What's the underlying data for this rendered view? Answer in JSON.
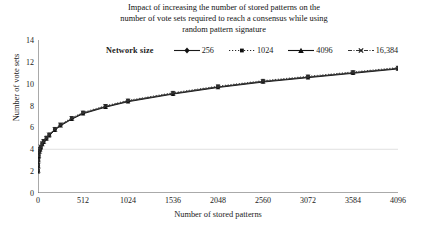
{
  "chart_data": {
    "type": "line",
    "title": "Impact of increasing the number of stored patterns on the number of vote sets required to reach a consensus while using random pattern signature",
    "title_lines": [
      "Impact of increasing the number of stored patterns on the",
      "number of vote sets required to reach a consensus while using",
      "random pattern signature"
    ],
    "xlabel": "Number of stored patterns",
    "ylabel": "Number of vote sets",
    "xlim": [
      0,
      4096
    ],
    "ylim": [
      0,
      14
    ],
    "xticks": [
      0,
      512,
      1024,
      1536,
      2048,
      2560,
      3072,
      3584,
      4096
    ],
    "xtick_labels": [
      "0",
      "512",
      "1024",
      "1536",
      "2048",
      "2560",
      "3072",
      "3584",
      "4096"
    ],
    "yticks": [
      0,
      2,
      4,
      6,
      8,
      10,
      12,
      14
    ],
    "ytick_labels": [
      "0",
      "2",
      "4",
      "6",
      "8",
      "10",
      "12",
      "14"
    ],
    "grid": "horizontal-faint",
    "gridlines_y": [
      4
    ],
    "legend_position": "top-center",
    "legend_title": "Network size",
    "x": [
      1,
      2,
      4,
      8,
      16,
      24,
      32,
      48,
      64,
      96,
      128,
      192,
      256,
      384,
      512,
      768,
      1024,
      1536,
      2048,
      2560,
      3072,
      3584,
      4096
    ],
    "series": [
      {
        "name": "256",
        "line_style": "solid",
        "marker": "diamond",
        "color": "#1a1a1a",
        "values": [
          2.0,
          2.5,
          3.0,
          3.4,
          3.8,
          4.0,
          4.2,
          4.5,
          4.7,
          5.0,
          5.3,
          5.8,
          6.2,
          6.8,
          7.3,
          7.9,
          8.4,
          9.1,
          9.7,
          10.2,
          10.6,
          11.0,
          11.4
        ]
      },
      {
        "name": "1024",
        "line_style": "dotted",
        "marker": "square",
        "color": "#2a2a2a",
        "values": [
          2.1,
          2.6,
          3.05,
          3.45,
          3.85,
          4.05,
          4.25,
          4.55,
          4.78,
          5.08,
          5.38,
          5.88,
          6.28,
          6.88,
          7.38,
          7.98,
          8.48,
          9.18,
          9.78,
          10.28,
          10.68,
          11.08,
          11.48
        ]
      },
      {
        "name": "4096",
        "line_style": "solid",
        "marker": "triangle",
        "color": "#111111",
        "values": [
          1.95,
          2.45,
          2.95,
          3.35,
          3.75,
          3.95,
          4.15,
          4.45,
          4.65,
          4.95,
          5.25,
          5.75,
          6.15,
          6.75,
          7.25,
          7.85,
          8.35,
          9.05,
          9.65,
          10.15,
          10.55,
          10.95,
          11.35
        ]
      },
      {
        "name": "16,384",
        "line_style": "dashdot",
        "marker": "x",
        "color": "#333333",
        "values": [
          2.05,
          2.55,
          3.02,
          3.42,
          3.82,
          4.02,
          4.22,
          4.52,
          4.72,
          5.02,
          5.32,
          5.82,
          6.22,
          6.82,
          7.32,
          7.92,
          8.42,
          9.12,
          9.72,
          10.22,
          10.62,
          11.02,
          11.42
        ]
      }
    ]
  }
}
